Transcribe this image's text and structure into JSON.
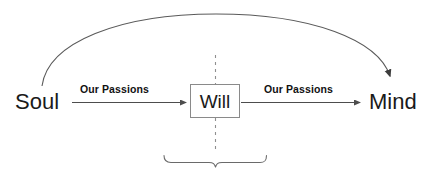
{
  "diagram": {
    "background_color": "#ffffff",
    "line_color": "#5a5a5a",
    "box_border_color": "#8a8a8a",
    "text_color": "#1a1a1a",
    "nodes": [
      {
        "id": "soul",
        "label": "Soul",
        "shape": "text"
      },
      {
        "id": "will",
        "label": "Will",
        "shape": "rectangle"
      },
      {
        "id": "mind",
        "label": "Mind",
        "shape": "text"
      }
    ],
    "edges": [
      {
        "id": "soul-to-will",
        "from": "Soul",
        "to": "Will",
        "label": "Our Passions",
        "style": "straight-arrow"
      },
      {
        "id": "will-to-mind",
        "from": "Will",
        "to": "Mind",
        "label": "Our Passions",
        "style": "straight-arrow"
      },
      {
        "id": "soul-to-mind-curved",
        "from": "Soul",
        "to": "Mind",
        "label": "",
        "style": "curved-arc-arrow"
      }
    ],
    "annotations": [
      {
        "id": "vertical-divider",
        "style": "dashed-vertical-line",
        "label": ""
      },
      {
        "id": "bottom-brace",
        "style": "curly-brace",
        "label": ""
      }
    ]
  }
}
